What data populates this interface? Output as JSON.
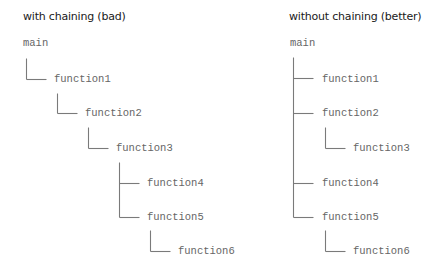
{
  "diagrams": [
    {
      "title": "with chaining (bad)",
      "title_pos": [
        23,
        10
      ],
      "nodes": [
        {
          "label": "main",
          "x": 23,
          "y": 37
        },
        {
          "label": "function1",
          "x": 54,
          "y": 73
        },
        {
          "label": "function2",
          "x": 85,
          "y": 107
        },
        {
          "label": "function3",
          "x": 116,
          "y": 142
        },
        {
          "label": "function4",
          "x": 147,
          "y": 177
        },
        {
          "label": "function5",
          "x": 147,
          "y": 211
        },
        {
          "label": "function6",
          "x": 178,
          "y": 245
        }
      ],
      "lines": [
        [
          26,
          58,
          26,
          79
        ],
        [
          26,
          79,
          46,
          79
        ],
        [
          57,
          93,
          57,
          113
        ],
        [
          57,
          113,
          77,
          113
        ],
        [
          88,
          127,
          88,
          148
        ],
        [
          88,
          148,
          108,
          148
        ],
        [
          119,
          162,
          119,
          217
        ],
        [
          119,
          183,
          139,
          183
        ],
        [
          119,
          217,
          139,
          217
        ],
        [
          150,
          230,
          150,
          251
        ],
        [
          150,
          251,
          170,
          251
        ]
      ]
    },
    {
      "title": "without chaining (better)",
      "title_pos": [
        289,
        10
      ],
      "nodes": [
        {
          "label": "main",
          "x": 290,
          "y": 37
        },
        {
          "label": "function1",
          "x": 322,
          "y": 73
        },
        {
          "label": "function2",
          "x": 322,
          "y": 107
        },
        {
          "label": "function3",
          "x": 353,
          "y": 142
        },
        {
          "label": "function4",
          "x": 322,
          "y": 177
        },
        {
          "label": "function5",
          "x": 322,
          "y": 211
        },
        {
          "label": "function6",
          "x": 353,
          "y": 245
        }
      ],
      "lines": [
        [
          293,
          57,
          293,
          217
        ],
        [
          293,
          78,
          313,
          78
        ],
        [
          293,
          113,
          313,
          113
        ],
        [
          293,
          183,
          313,
          183
        ],
        [
          293,
          217,
          313,
          217
        ],
        [
          325,
          127,
          325,
          148
        ],
        [
          325,
          148,
          345,
          148
        ],
        [
          325,
          230,
          325,
          251
        ],
        [
          325,
          251,
          345,
          251
        ]
      ]
    }
  ],
  "colors": {
    "title": "#1a1a1a",
    "node_text": "#666666",
    "connector": "#7a7a7a",
    "background": "#ffffff"
  }
}
